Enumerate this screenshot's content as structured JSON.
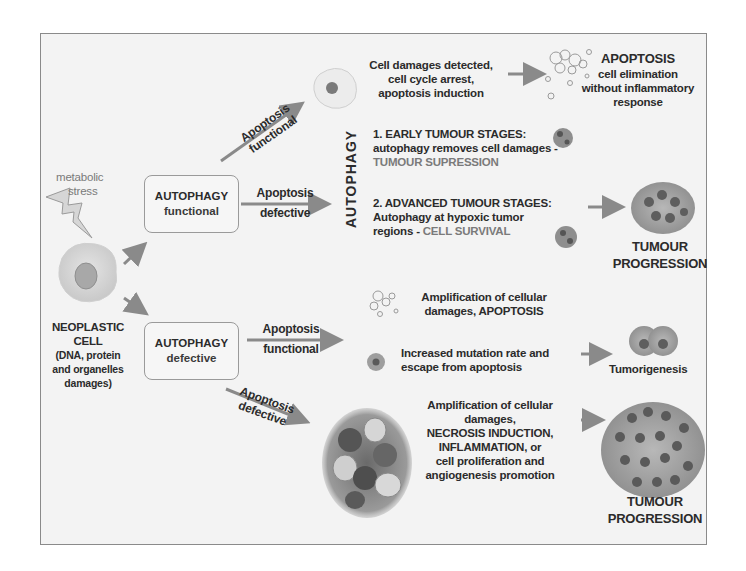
{
  "diagram": {
    "left": {
      "stress_label_line1": "metabolic",
      "stress_label_line2": "stress",
      "cell_title_line1": "NEOPLASTIC",
      "cell_title_line2": "CELL",
      "cell_desc_line1": "(DNA, protein",
      "cell_desc_line2": "and organelles",
      "cell_desc_line3": "damages)"
    },
    "boxes": {
      "functional": {
        "title": "AUTOPHAGY",
        "state": "functional"
      },
      "defective": {
        "title": "AUTOPHAGY",
        "state": "defective"
      }
    },
    "arrows": {
      "top_diag_line1": "Apoptosis",
      "top_diag_line2": "functional",
      "top_horiz_line1": "Apoptosis",
      "top_horiz_line2": "defective",
      "bottom_horiz_line1": "Apoptosis",
      "bottom_horiz_line2": "functional",
      "bottom_diag_line1": "Apoptosis",
      "bottom_diag_line2": "defective"
    },
    "upper_branch": {
      "detect_line1": "Cell damages detected,",
      "detect_line2": "cell cycle arrest,",
      "detect_line3": "apoptosis induction",
      "apoptosis_title": "APOPTOSIS",
      "apoptosis_line1": "cell elimination",
      "apoptosis_line2": "without inflammatory",
      "apoptosis_line3": "response",
      "vertical_label": "AUTOPHAGY",
      "early_line1": "1. EARLY TUMOUR STAGES:",
      "early_line2": "autophagy removes cell damages -",
      "early_line3": "TUMOUR SUPRESSION",
      "advanced_line1": "2. ADVANCED TUMOUR STAGES:",
      "advanced_line2": "Autophagy at hypoxic tumor",
      "advanced_line3_prefix": "regions - ",
      "advanced_line3_highlight": "CELL SURVIVAL",
      "progression_line1": "TUMOUR",
      "progression_line2": "PROGRESSION"
    },
    "lower_branch": {
      "amp_line1": "Amplification of cellular",
      "amp_line2": "damages, APOPTOSIS",
      "mut_line1": "Increased mutation rate and",
      "mut_line2": "escape from apoptosis",
      "tumorigenesis": "Tumorigenesis",
      "necrosis_line1": "Amplification of cellular",
      "necrosis_line2": "damages,",
      "necrosis_line3": "NECROSIS INDUCTION,",
      "necrosis_line4": "INFLAMMATION, or",
      "necrosis_line5": "cell proliferation and",
      "necrosis_line6": "angiogenesis promotion",
      "progression_line1": "TUMOUR",
      "progression_line2": "PROGRESSION"
    },
    "colors": {
      "arrow": "#8a8a8a",
      "highlight_text": "#7a7a7a",
      "frame_border": "#8a8a8a",
      "background": "#f3f3f3"
    }
  }
}
